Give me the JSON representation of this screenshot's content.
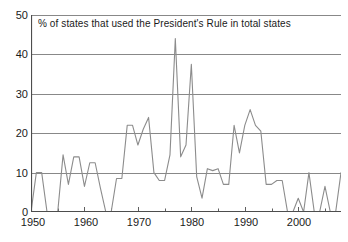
{
  "chart_data": {
    "type": "line",
    "title": "% of states that used the President's Rule in total states",
    "xlabel": "",
    "ylabel": "",
    "xlim": [
      1950,
      2008
    ],
    "ylim": [
      0,
      50
    ],
    "yticks": [
      0,
      10,
      20,
      30,
      40,
      50
    ],
    "xticks": [
      1950,
      1960,
      1970,
      1980,
      1990,
      2000
    ],
    "xtick_labels": [
      "1950",
      "1960",
      "1970",
      "1980",
      "1990",
      "2000"
    ],
    "ytick_labels": [
      "0",
      "10",
      "20",
      "30",
      "40",
      "50"
    ],
    "xtick_minor_step": 5,
    "grid": "horizontal",
    "legend": "none",
    "line_color": "#8c8c8c",
    "axis_color": "#4d4d4d",
    "grid_color": "#7a7a7a",
    "x": [
      1950,
      1951,
      1952,
      1953,
      1954,
      1955,
      1956,
      1957,
      1958,
      1959,
      1960,
      1961,
      1962,
      1963,
      1964,
      1965,
      1966,
      1967,
      1968,
      1969,
      1970,
      1971,
      1972,
      1973,
      1974,
      1975,
      1976,
      1977,
      1978,
      1979,
      1980,
      1981,
      1982,
      1983,
      1984,
      1985,
      1986,
      1987,
      1988,
      1989,
      1990,
      1991,
      1992,
      1993,
      1994,
      1995,
      1996,
      1997,
      1998,
      1999,
      2000,
      2001,
      2002,
      2003,
      2004,
      2005,
      2006,
      2007,
      2008
    ],
    "values": [
      0,
      10,
      10,
      0,
      0,
      0,
      14.5,
      7,
      14,
      14,
      6.5,
      12.5,
      12.5,
      6,
      0,
      0,
      8.5,
      8.5,
      22,
      22,
      17,
      21,
      24,
      10,
      8,
      8,
      14.5,
      44,
      14,
      17,
      37.5,
      9,
      3.5,
      11,
      10.5,
      11,
      7,
      7,
      22,
      15,
      22,
      26,
      22,
      20.5,
      7,
      7,
      8,
      8,
      0,
      0,
      3.5,
      0,
      10,
      0,
      0,
      6.5,
      0,
      0,
      10
    ],
    "series_name": "% of states under President's Rule",
    "peak_value": 44,
    "peak_year": 1977,
    "units": "percent"
  },
  "axes": {
    "y_tick_labels": [
      "50",
      "40",
      "30",
      "20",
      "10",
      "0"
    ],
    "x_tick_labels": [
      "1950",
      "1960",
      "1970",
      "1980",
      "1990",
      "2000"
    ]
  }
}
